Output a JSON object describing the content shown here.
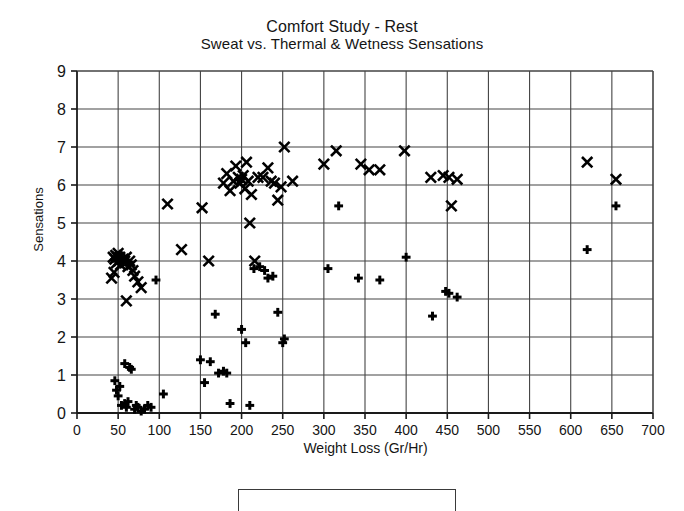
{
  "chart_data": {
    "type": "scatter",
    "title": "Comfort Study - Rest",
    "subtitle": "Sweat vs. Thermal & Wetness Sensations",
    "xlabel": "Weight Loss (Gr/Hr)",
    "ylabel": "Sensations",
    "xlim": [
      0,
      700
    ],
    "ylim": [
      0,
      9
    ],
    "xticks": [
      0,
      50,
      100,
      150,
      200,
      250,
      300,
      350,
      400,
      450,
      500,
      550,
      600,
      650,
      700
    ],
    "yticks": [
      0,
      1,
      2,
      3,
      4,
      5,
      6,
      7,
      8,
      9
    ],
    "xtick_labels": [
      "0",
      "50",
      "100",
      "150",
      "200",
      "250",
      "300",
      "350",
      "400",
      "450",
      "500",
      "550",
      "600",
      "650",
      "700"
    ],
    "ytick_labels": [
      "0",
      "1",
      "2",
      "3",
      "4",
      "5",
      "6",
      "7",
      "8",
      "9"
    ],
    "grid": true,
    "grid_color": "#444444",
    "legend_position": "below-plot-cropped",
    "series": [
      {
        "name": "Thermal Sensation",
        "marker": "x",
        "color": "#000000",
        "points": [
          [
            44,
            4.1
          ],
          [
            46,
            4.05
          ],
          [
            47,
            4.15
          ],
          [
            48,
            3.95
          ],
          [
            49,
            4.1
          ],
          [
            50,
            4.2
          ],
          [
            51,
            4.0
          ],
          [
            52,
            4.1
          ],
          [
            53,
            3.9
          ],
          [
            45,
            3.7
          ],
          [
            42,
            3.55
          ],
          [
            56,
            4.05
          ],
          [
            58,
            4.0
          ],
          [
            60,
            4.1
          ],
          [
            62,
            3.85
          ],
          [
            64,
            4.0
          ],
          [
            66,
            3.9
          ],
          [
            68,
            3.75
          ],
          [
            70,
            3.6
          ],
          [
            74,
            3.45
          ],
          [
            78,
            3.3
          ],
          [
            60,
            2.95
          ],
          [
            110,
            5.5
          ],
          [
            127,
            4.3
          ],
          [
            152,
            5.4
          ],
          [
            160,
            4.0
          ],
          [
            178,
            6.05
          ],
          [
            182,
            6.3
          ],
          [
            186,
            5.85
          ],
          [
            190,
            6.1
          ],
          [
            193,
            6.5
          ],
          [
            196,
            6.2
          ],
          [
            198,
            6.05
          ],
          [
            200,
            6.15
          ],
          [
            202,
            6.25
          ],
          [
            204,
            5.9
          ],
          [
            206,
            6.6
          ],
          [
            208,
            6.1
          ],
          [
            210,
            5.0
          ],
          [
            212,
            5.75
          ],
          [
            216,
            4.0
          ],
          [
            220,
            6.2
          ],
          [
            226,
            6.2
          ],
          [
            232,
            6.45
          ],
          [
            236,
            6.1
          ],
          [
            240,
            6.05
          ],
          [
            244,
            5.6
          ],
          [
            248,
            5.95
          ],
          [
            252,
            7.0
          ],
          [
            262,
            6.1
          ],
          [
            300,
            6.55
          ],
          [
            315,
            6.9
          ],
          [
            345,
            6.55
          ],
          [
            355,
            6.4
          ],
          [
            368,
            6.4
          ],
          [
            398,
            6.9
          ],
          [
            430,
            6.2
          ],
          [
            445,
            6.25
          ],
          [
            452,
            6.2
          ],
          [
            462,
            6.15
          ],
          [
            455,
            5.45
          ],
          [
            620,
            6.6
          ],
          [
            655,
            6.15
          ]
        ]
      },
      {
        "name": "Wetness Sensation",
        "marker": "+",
        "color": "#000000",
        "points": [
          [
            46,
            0.85
          ],
          [
            48,
            0.6
          ],
          [
            50,
            0.45
          ],
          [
            52,
            0.7
          ],
          [
            54,
            0.2
          ],
          [
            58,
            0.25
          ],
          [
            60,
            0.15
          ],
          [
            62,
            0.3
          ],
          [
            64,
            1.2
          ],
          [
            66,
            1.15
          ],
          [
            70,
            0.1
          ],
          [
            72,
            0.2
          ],
          [
            74,
            0.15
          ],
          [
            78,
            0.05
          ],
          [
            82,
            0.1
          ],
          [
            86,
            0.2
          ],
          [
            90,
            0.15
          ],
          [
            58,
            1.3
          ],
          [
            96,
            3.5
          ],
          [
            105,
            0.5
          ],
          [
            150,
            1.4
          ],
          [
            155,
            0.8
          ],
          [
            162,
            1.35
          ],
          [
            172,
            1.05
          ],
          [
            178,
            1.1
          ],
          [
            182,
            1.05
          ],
          [
            186,
            0.25
          ],
          [
            200,
            2.2
          ],
          [
            205,
            1.85
          ],
          [
            210,
            0.2
          ],
          [
            215,
            3.8
          ],
          [
            222,
            3.85
          ],
          [
            228,
            3.75
          ],
          [
            232,
            3.55
          ],
          [
            238,
            3.6
          ],
          [
            244,
            2.65
          ],
          [
            250,
            1.85
          ],
          [
            252,
            1.95
          ],
          [
            168,
            2.6
          ],
          [
            305,
            3.8
          ],
          [
            318,
            5.45
          ],
          [
            342,
            3.55
          ],
          [
            368,
            3.5
          ],
          [
            400,
            4.1
          ],
          [
            432,
            2.55
          ],
          [
            448,
            3.2
          ],
          [
            452,
            3.15
          ],
          [
            462,
            3.05
          ],
          [
            620,
            4.3
          ],
          [
            655,
            5.45
          ]
        ]
      }
    ]
  },
  "figure": {
    "background": "#ffffff",
    "axis_color": "#1a1a1a"
  }
}
